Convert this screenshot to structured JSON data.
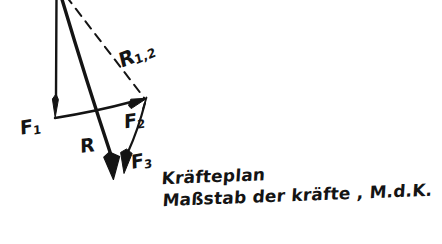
{
  "document": {
    "kind": "hand-drawn-force-diagram",
    "background_color": "#ffffff",
    "ink_color": "#141414",
    "width": 442,
    "height": 244
  },
  "vector_labels": {
    "f1": {
      "base": "F",
      "sub": "1"
    },
    "f2": {
      "base": "F",
      "sub": "2"
    },
    "f3": {
      "base": "F",
      "sub": "3"
    },
    "r": {
      "base": "R",
      "sub": ""
    },
    "r12": {
      "base": "R",
      "sub": "1,2"
    }
  },
  "caption": {
    "line1": "Kräfteplan",
    "line2": "Maßstab der kräfte , M.d.K."
  },
  "geometry": {
    "origin": {
      "x": 56,
      "y": 0
    },
    "vectors": [
      {
        "name": "F1",
        "x1": 56,
        "y1": 0,
        "x2": 56,
        "y2": 117,
        "style": "solid",
        "arrow": true
      },
      {
        "name": "R",
        "x1": 62,
        "y1": 0,
        "x2": 117,
        "y2": 176,
        "style": "solid",
        "arrow": true
      },
      {
        "name": "R1,2",
        "x1": 68,
        "y1": 0,
        "x2": 146,
        "y2": 100,
        "style": "dashed",
        "arrow": false
      },
      {
        "name": "F2",
        "x1": 56,
        "y1": 117,
        "x2": 146,
        "y2": 100,
        "style": "solid",
        "arrow": true
      },
      {
        "name": "F3",
        "x1": 146,
        "y1": 100,
        "x2": 124,
        "y2": 172,
        "style": "solid",
        "arrow": true
      }
    ]
  }
}
